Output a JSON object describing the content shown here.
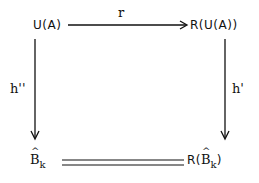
{
  "diagram": {
    "type": "commutative-square",
    "nodes": {
      "top_left": "U(A)",
      "top_right": "R(U(A))",
      "bottom_left": {
        "base": "B",
        "hat": true,
        "subscript": "k"
      },
      "bottom_right": {
        "prefix": "R(",
        "base": "B",
        "hat": true,
        "subscript": "k",
        "suffix": ")"
      }
    },
    "edges": {
      "top": {
        "label": "r",
        "from": "U(A)",
        "to": "R(U(A))",
        "style": "arrow"
      },
      "left": {
        "label": "h''",
        "from": "U(A)",
        "to": "B̂_k",
        "style": "arrow"
      },
      "right": {
        "label": "h'",
        "from": "R(U(A))",
        "to": "R(B̂_k)",
        "style": "arrow"
      },
      "bottom": {
        "label": "",
        "from": "B̂_k",
        "to": "R(B̂_k)",
        "style": "double-line-equality"
      }
    }
  }
}
